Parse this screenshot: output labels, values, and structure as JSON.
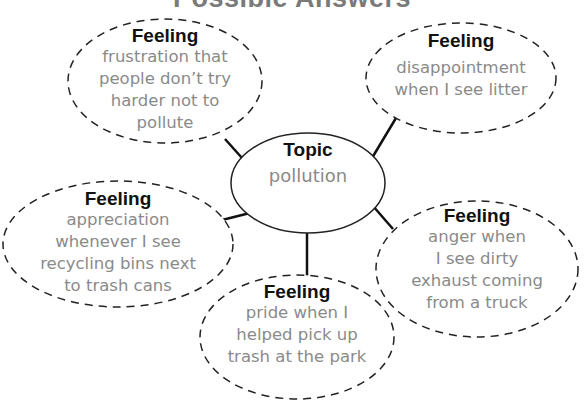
{
  "title": "Possible Answers",
  "topic": {
    "heading": "Topic",
    "text": "pollution"
  },
  "feelings": [
    {
      "id": "top-left",
      "heading": "Feeling",
      "lines": [
        "frustration that",
        "people don’t try",
        "harder not to",
        "pollute"
      ]
    },
    {
      "id": "top-right",
      "heading": "Feeling",
      "lines": [
        "disappointment",
        "when I see litter"
      ]
    },
    {
      "id": "left",
      "heading": "Feeling",
      "lines": [
        "appreciation",
        "whenever I see",
        "recycling bins next",
        "to trash cans"
      ]
    },
    {
      "id": "bottom",
      "heading": "Feeling",
      "lines": [
        "pride when I",
        "helped pick up",
        "trash at the park"
      ]
    },
    {
      "id": "right",
      "heading": "Feeling",
      "lines": [
        "anger when",
        "I see dirty",
        "exhaust coming",
        "from a truck"
      ]
    }
  ],
  "colors": {
    "heading": "#111111",
    "body_text": "#8a8a8a",
    "title": "#7a7a7a",
    "outline": "#222222"
  }
}
